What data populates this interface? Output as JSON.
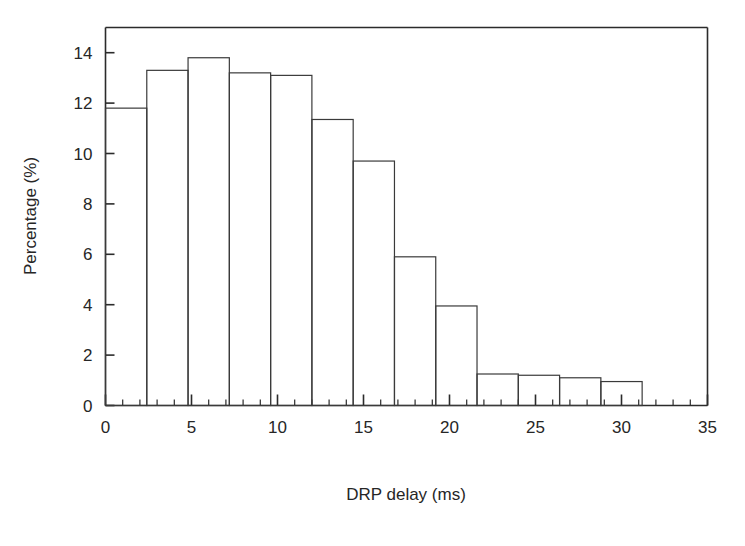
{
  "figure": {
    "background_color": "#ffffff",
    "line_color": "#2b2b2b"
  },
  "chart_data": {
    "type": "bar",
    "title": "",
    "subtitle": "",
    "xlabel": "DRP delay (ms)",
    "ylabel": "Percentage (%)",
    "xlim": [
      0,
      35
    ],
    "ylim": [
      0,
      15
    ],
    "grid": false,
    "legend": null,
    "bar_style": "histogram-outline",
    "bin_width": 2.4,
    "x_ticks": [
      0,
      5,
      10,
      15,
      20,
      25,
      30,
      35
    ],
    "x_tick_labels": [
      "0",
      "5",
      "10",
      "15",
      "20",
      "25",
      "30",
      "35"
    ],
    "x_minor_tick_interval": 1,
    "y_ticks": [
      0,
      2,
      4,
      6,
      8,
      10,
      12,
      14
    ],
    "y_tick_labels": [
      "0",
      "2",
      "4",
      "6",
      "8",
      "10",
      "12",
      "14"
    ],
    "bin_edges": [
      0.0,
      2.4,
      4.8,
      7.2,
      9.6,
      12.0,
      14.4,
      16.8,
      19.2,
      21.6,
      24.0,
      26.4,
      28.8,
      31.2
    ],
    "categories": [
      "0-2.4",
      "2.4-4.8",
      "4.8-7.2",
      "7.2-9.6",
      "9.6-12.0",
      "12.0-14.4",
      "14.4-16.8",
      "16.8-19.2",
      "19.2-21.6",
      "21.6-24.0",
      "24.0-26.4",
      "26.4-28.8",
      "28.8-31.2"
    ],
    "values": [
      11.8,
      13.3,
      13.8,
      13.2,
      13.1,
      11.35,
      9.7,
      5.9,
      3.95,
      1.25,
      1.2,
      1.1,
      0.95
    ]
  }
}
